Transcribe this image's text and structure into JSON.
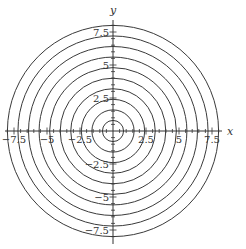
{
  "chart_data": {
    "type": "line",
    "title": "",
    "xlabel": "x",
    "ylabel": "y",
    "xlim": [
      -8.2,
      8.2
    ],
    "ylim": [
      -8.6,
      8.4
    ],
    "grid": false,
    "circles": {
      "center": [
        0,
        0
      ],
      "radii": [
        0.8,
        1.6,
        2.4,
        3.2,
        4.0,
        4.8,
        5.6,
        6.4,
        7.2,
        8.0
      ]
    },
    "x_ticks": {
      "major": [
        -7.5,
        -5,
        -2.5,
        2.5,
        5,
        7.5
      ],
      "labels": [
        "−7.5",
        "−5",
        "−2.5",
        "2.5",
        "5",
        "7.5"
      ],
      "minor_step": 0.5
    },
    "y_ticks": {
      "major": [
        -7.5,
        -5,
        -2.5,
        2.5,
        5,
        7.5
      ],
      "labels": [
        "−7.5",
        "−5",
        "−2.5",
        "2.5",
        "5",
        "7.5"
      ],
      "minor_step": 0.5
    },
    "colors": {
      "stroke": "#3a3a3a",
      "axis": "#333333"
    }
  }
}
